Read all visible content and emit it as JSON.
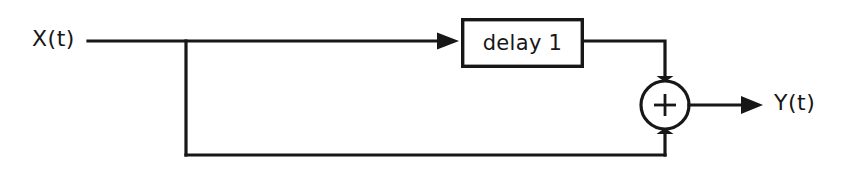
{
  "diagram": {
    "type": "signal-flow-block-diagram",
    "background_color": "#ffffff",
    "line_color": "#171717",
    "input": {
      "label": "X(t)",
      "name": "input-signal-label"
    },
    "output": {
      "label": "Y(t)",
      "name": "output-signal-label"
    },
    "blocks": [
      {
        "name": "delay-block",
        "label": "delay 1",
        "shape": "rectangle",
        "x": 461,
        "y": 18,
        "width": 123,
        "height": 50
      }
    ],
    "junctions": [
      {
        "name": "summing-junction",
        "label": "+",
        "shape": "circle",
        "cx": 665,
        "cy": 105,
        "r": 25
      },
      {
        "name": "branch-point",
        "label": "",
        "shape": "tee",
        "cx": 186,
        "cy": 41
      }
    ],
    "paths": [
      {
        "name": "input-to-branch-wire",
        "from": "X(t)",
        "to": "branch-point"
      },
      {
        "name": "branch-to-delay-wire",
        "from": "branch-point",
        "to": "delay-block",
        "arrow": true
      },
      {
        "name": "delay-to-sum-wire",
        "from": "delay-block",
        "to": "summing-junction",
        "arrow": true
      },
      {
        "name": "feedthrough-wire",
        "from": "branch-point",
        "to": "summing-junction",
        "arrow": true
      },
      {
        "name": "sum-to-output-wire",
        "from": "summing-junction",
        "to": "Y(t)",
        "arrow": true
      }
    ]
  }
}
